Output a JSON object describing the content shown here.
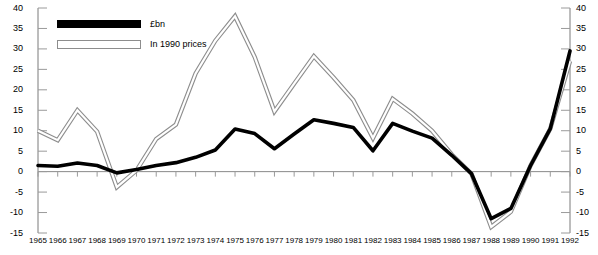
{
  "chart_data": {
    "type": "line",
    "title": "",
    "subtitle": "",
    "xlabel": "",
    "ylabel": "",
    "grid": false,
    "legend_position": "top-left",
    "ylim": [
      -15,
      40
    ],
    "y_ticks": [
      40,
      35,
      30,
      25,
      20,
      15,
      10,
      5,
      0,
      -5,
      -10,
      -15
    ],
    "y_tick_labels": [
      "40",
      "35",
      "30",
      "25",
      "20",
      "15",
      "10",
      "5",
      "0",
      "-5",
      "-10",
      "-15"
    ],
    "dual_y_axis": true,
    "categories": [
      "1965",
      "1966",
      "1967",
      "1968",
      "1969",
      "1970",
      "1971",
      "1972",
      "1973",
      "1974",
      "1975",
      "1976",
      "1977",
      "1978",
      "1979",
      "1980",
      "1981",
      "1982",
      "1983",
      "1984",
      "1985",
      "1986",
      "1987",
      "1988",
      "1989",
      "1990",
      "1991",
      "1992"
    ],
    "series": [
      {
        "name": "£bn",
        "color": "#000000",
        "style": "solid-thick",
        "values": [
          1.5,
          1.3,
          2.1,
          1.5,
          -0.3,
          0.5,
          1.5,
          2.2,
          3.5,
          5.3,
          10.4,
          9.3,
          5.6,
          9.2,
          12.7,
          11.8,
          10.8,
          5.1,
          11.8,
          9.9,
          8.2,
          4.0,
          -0.5,
          -11.5,
          -9.0,
          1.5,
          10.5,
          29.5
        ]
      },
      {
        "name": "In 1990 prices",
        "color": "#8d8d8d",
        "style": "hollow-thick",
        "values": [
          10.0,
          7.7,
          15.0,
          9.8,
          -3.8,
          0.3,
          8.0,
          11.5,
          24.0,
          32.0,
          38.0,
          28.0,
          14.7,
          21.5,
          28.2,
          23.0,
          17.5,
          8.2,
          17.8,
          14.2,
          10.0,
          4.2,
          -0.5,
          -13.5,
          -9.8,
          1.5,
          10.5,
          27.0
        ]
      }
    ]
  },
  "legend": {
    "items": [
      {
        "label": "£bn",
        "swatch": "solid"
      },
      {
        "label": "In 1990 prices",
        "swatch": "hollow"
      }
    ]
  },
  "axes": {
    "left_label": "left-value-axis",
    "right_label": "right-value-axis",
    "bottom_label": "year-axis"
  }
}
